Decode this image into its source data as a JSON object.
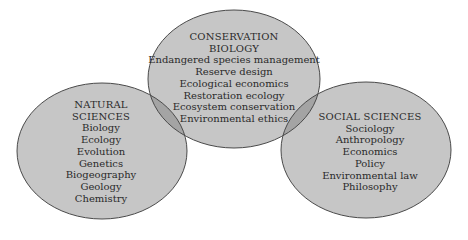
{
  "colors": {
    "background": "#ffffff",
    "fill": "#c6c6c6",
    "overlap": "#a4a4a4",
    "stroke": "#4a4a4a",
    "text": "#2a2a2a"
  },
  "circles": {
    "conservation": {
      "title_lines": [
        "CONSERVATION",
        "BIOLOGY"
      ],
      "items": [
        "Endangered species management",
        "Reserve design",
        "Ecological economics",
        "Restoration ecology",
        "Ecosystem conservation",
        "Environmental ethics"
      ]
    },
    "natural": {
      "title_lines": [
        "NATURAL",
        "SCIENCES"
      ],
      "items": [
        "Biology",
        "Ecology",
        "Evolution",
        "Genetics",
        "Biogeography",
        "Geology",
        "Chemistry"
      ]
    },
    "social": {
      "title_lines": [
        "SOCIAL SCIENCES"
      ],
      "items": [
        "Sociology",
        "Anthropology",
        "Economics",
        "Policy",
        "Environmental law",
        "Philosophy"
      ]
    }
  }
}
